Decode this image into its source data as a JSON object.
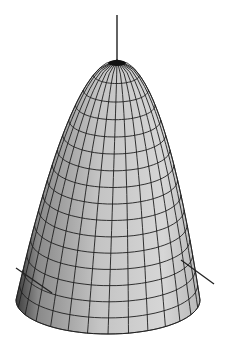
{
  "figure": {
    "caption_fragment": "",
    "surface": {
      "type": "paraboloid",
      "apex": [
        117,
        60
      ],
      "base_center": [
        108,
        300
      ],
      "base_rx": 92,
      "base_ry": 34,
      "height": 240,
      "rings": 16,
      "meridians": 28,
      "fill_light": "#d0d0d0",
      "fill_mid": "#a8a8a8",
      "fill_dark": "#4a4a4a",
      "grid_color": "#1e1e1e"
    },
    "axes": {
      "z_axis": {
        "from": [
          117,
          15
        ],
        "to": [
          117,
          60
        ],
        "color": "#222222"
      },
      "x_tick": {
        "from": [
          16,
          268
        ],
        "to": [
          52,
          293
        ],
        "color": "#222222"
      },
      "y_tick": {
        "from": [
          181,
          260
        ],
        "to": [
          214,
          284
        ],
        "color": "#222222"
      }
    }
  }
}
